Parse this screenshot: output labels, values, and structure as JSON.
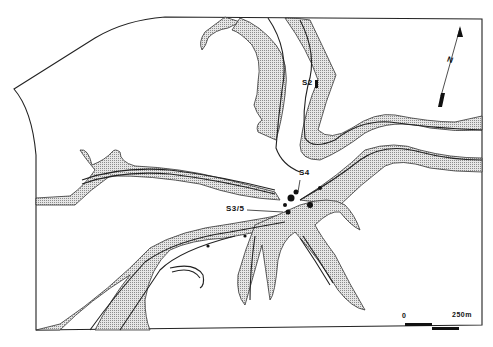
{
  "map": {
    "type": "site map",
    "colors": {
      "background": "#ffffff",
      "ink": "#222222",
      "stipple": "#bdbdbd"
    },
    "labels": [
      {
        "id": "S2",
        "text": "S2",
        "x": 302,
        "y": 82
      },
      {
        "id": "S4",
        "text": "S4",
        "x": 299,
        "y": 172
      },
      {
        "id": "S3/5",
        "text": "S3/5",
        "x": 226,
        "y": 207
      }
    ],
    "north_arrow": {
      "label": "N",
      "icon": "north-arrow-icon"
    },
    "scale_bar": {
      "start_label": "0",
      "end_label": "250m"
    }
  }
}
